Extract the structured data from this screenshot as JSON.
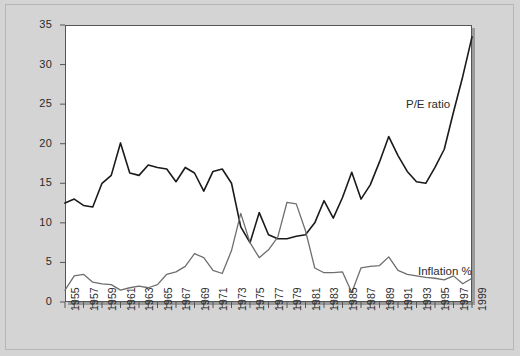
{
  "chart_data": {
    "type": "line",
    "title": "",
    "subtitle": "",
    "xlabel": "",
    "ylabel": "",
    "xlim": [
      1955,
      1999
    ],
    "ylim": [
      0,
      35
    ],
    "yticks": [
      0,
      5,
      10,
      15,
      20,
      25,
      30,
      35
    ],
    "ytick_labels": [
      "0",
      "5",
      "10",
      "15",
      "20",
      "25",
      "30",
      "35"
    ],
    "x": [
      1955,
      1956,
      1957,
      1958,
      1959,
      1960,
      1961,
      1962,
      1963,
      1964,
      1965,
      1966,
      1967,
      1968,
      1969,
      1970,
      1971,
      1972,
      1973,
      1974,
      1975,
      1976,
      1977,
      1978,
      1979,
      1980,
      1981,
      1982,
      1983,
      1984,
      1985,
      1986,
      1987,
      1988,
      1989,
      1990,
      1991,
      1992,
      1993,
      1994,
      1995,
      1996,
      1997,
      1998,
      1999
    ],
    "xtick_labels": [
      "1955",
      "1957",
      "1959",
      "1961",
      "1963",
      "1965",
      "1967",
      "1969",
      "1971",
      "1973",
      "1975",
      "1977",
      "1979",
      "1981",
      "1983",
      "1985",
      "1987",
      "1989",
      "1991",
      "1993",
      "1995",
      "1997",
      "1999"
    ],
    "xticks_labeled": [
      1955,
      1957,
      1959,
      1961,
      1963,
      1965,
      1967,
      1969,
      1971,
      1973,
      1975,
      1977,
      1979,
      1981,
      1983,
      1985,
      1987,
      1989,
      1991,
      1993,
      1995,
      1997,
      1999
    ],
    "minor_ticks_every": 1,
    "grid": false,
    "legend_position": "inline-annotation",
    "series": [
      {
        "name": "P/E ratio",
        "color": "#1a1a1a",
        "linewidth": 1.6,
        "values": [
          12.5,
          13.0,
          12.2,
          12.0,
          15.0,
          16.0,
          20.1,
          16.3,
          16.0,
          17.3,
          17.0,
          16.8,
          15.2,
          17.0,
          16.3,
          14.0,
          16.5,
          16.8,
          15.0,
          9.5,
          7.5,
          11.3,
          8.5,
          8.0,
          8.0,
          8.3,
          8.5,
          10.0,
          12.8,
          10.6,
          13.2,
          16.4,
          13.0,
          14.8,
          17.7,
          20.9,
          18.5,
          16.5,
          15.2,
          15.0,
          17.0,
          19.3,
          24.0,
          28.5,
          33.5
        ]
      },
      {
        "name": "Inflation %",
        "color": "#6e6e6e",
        "linewidth": 1.3,
        "values": [
          1.5,
          3.3,
          3.5,
          2.5,
          2.3,
          2.2,
          1.5,
          1.8,
          2.0,
          1.8,
          2.2,
          3.5,
          3.8,
          4.5,
          6.1,
          5.6,
          4.0,
          3.6,
          6.5,
          11.2,
          7.5,
          5.6,
          6.6,
          8.2,
          12.6,
          12.4,
          9.0,
          4.3,
          3.7,
          3.7,
          3.8,
          1.2,
          4.3,
          4.5,
          4.6,
          5.7,
          4.0,
          3.5,
          3.3,
          3.1,
          3.0,
          2.8,
          3.3,
          2.3,
          3.0
        ]
      }
    ],
    "annotations": [
      {
        "text": "P/E ratio",
        "series": "P/E ratio"
      },
      {
        "text": "Inflation %",
        "series": "Inflation %"
      }
    ]
  },
  "figure": {
    "background_color": "#d4d4d4",
    "plot_background_color": "#ffffff",
    "axis_color": "#555555"
  }
}
